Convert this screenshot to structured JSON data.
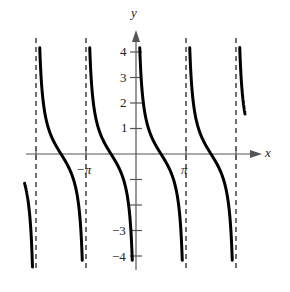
{
  "chart_data": {
    "type": "line",
    "title": "",
    "function": "y = cot(x)",
    "xlabel": "x",
    "ylabel": "y",
    "x_tick_labels": [
      "-π",
      "π"
    ],
    "x_ticks": [
      -6.283,
      -3.1416,
      3.1416,
      6.283
    ],
    "y_tick_labels": [
      "4",
      "3",
      "2",
      "1",
      "-3",
      "-4"
    ],
    "y_ticks": [
      4,
      3,
      2,
      1,
      -1,
      -2,
      -3,
      -4
    ],
    "xlim": [
      -7.2,
      7.6
    ],
    "ylim": [
      -4.5,
      4.8
    ],
    "grid": false,
    "legend": null,
    "asymptotes": [
      -6.283,
      -3.1416,
      3.1416,
      6.283
    ],
    "asymptote_style": "dashed",
    "series": [
      {
        "name": "branch_-2π_to_-π",
        "x_range": [
          -6.283,
          -3.1416
        ]
      },
      {
        "name": "branch_-π_to_0",
        "x_range": [
          -3.1416,
          0
        ]
      },
      {
        "name": "branch_0_to_π",
        "x_range": [
          0,
          3.1416
        ]
      },
      {
        "name": "branch_π_to_2π",
        "x_range": [
          3.1416,
          6.283
        ]
      },
      {
        "name": "partial_left_of_-2π",
        "x_range": [
          -7.0,
          -6.283
        ]
      },
      {
        "name": "partial_right_of_2π",
        "x_range": [
          6.283,
          6.85
        ]
      }
    ],
    "sample_points": [
      {
        "x": 0.25,
        "y": 3.9
      },
      {
        "x": 0.785,
        "y": 1.0
      },
      {
        "x": 1.571,
        "y": 0
      },
      {
        "x": 2.356,
        "y": -1.0
      },
      {
        "x": 2.89,
        "y": -3.9
      }
    ]
  },
  "labels": {
    "x_axis": "x",
    "y_axis": "y",
    "neg_pi": "−π",
    "pi": "π",
    "y4": "4",
    "y3": "3",
    "y2": "2",
    "y1": "1",
    "yn3": "−3",
    "yn4": "−4"
  }
}
